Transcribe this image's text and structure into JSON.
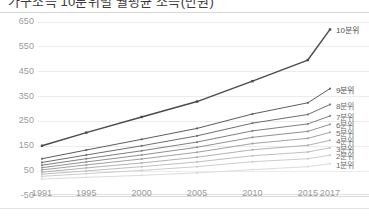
{
  "chart_data": {
    "type": "line",
    "title": "가구소득 10분위별 월평균 소득(만원)",
    "subtitle": "",
    "xlabel": "",
    "ylabel": "",
    "x": [
      1991,
      1995,
      2000,
      2005,
      2010,
      2015,
      2017
    ],
    "xtick_labels": [
      "1991",
      "1995",
      "2000",
      "2005",
      "2010",
      "2015",
      "2017"
    ],
    "ytick_labels": [
      "650",
      "550",
      "450",
      "350",
      "250",
      "150",
      "50",
      "-50"
    ],
    "ytick_values": [
      650,
      550,
      450,
      350,
      250,
      150,
      50,
      -50
    ],
    "ylim": [
      -50,
      680
    ],
    "xlim": [
      1991,
      2017
    ],
    "grid": true,
    "legend_position": "right-inline",
    "series": [
      {
        "name": "10분위",
        "label": "10분위",
        "color": "#4a4a4a",
        "values": [
          152,
          205,
          268,
          330,
          412,
          497,
          620
        ]
      },
      {
        "name": "9분위",
        "label": "9분위",
        "color": "#5c5c5c",
        "values": [
          100,
          135,
          178,
          222,
          280,
          325,
          382
        ]
      },
      {
        "name": "8분위",
        "label": "8분위",
        "color": "#6e6e6e",
        "values": [
          85,
          115,
          152,
          192,
          243,
          278,
          318
        ]
      },
      {
        "name": "7분위",
        "label": "7분위",
        "color": "#808080",
        "values": [
          74,
          100,
          132,
          167,
          212,
          240,
          272
        ]
      },
      {
        "name": "6분위",
        "label": "6분위",
        "color": "#929292",
        "values": [
          64,
          87,
          115,
          146,
          186,
          210,
          238
        ]
      },
      {
        "name": "5분위",
        "label": "5분위",
        "color": "#a2a2a2",
        "values": [
          55,
          75,
          99,
          126,
          161,
          182,
          206
        ]
      },
      {
        "name": "4분위",
        "label": "4분위",
        "color": "#b2b2b2",
        "values": [
          46,
          63,
          83,
          106,
          136,
          154,
          174
        ]
      },
      {
        "name": "3분위",
        "label": "3분위",
        "color": "#c0c0c0",
        "values": [
          38,
          51,
          68,
          87,
          112,
          127,
          144
        ]
      },
      {
        "name": "2분위",
        "label": "2분위",
        "color": "#cdcdcd",
        "values": [
          29,
          40,
          53,
          68,
          88,
          100,
          114
        ]
      },
      {
        "name": "1분위",
        "label": "1분위",
        "color": "#dcdcdc",
        "values": [
          18,
          25,
          33,
          43,
          56,
          68,
          80
        ]
      }
    ]
  },
  "axis": {
    "y_labels": [
      "650",
      "550",
      "450",
      "350",
      "250",
      "150",
      "50",
      "-50"
    ],
    "x_labels": [
      "1991",
      "1995",
      "2000",
      "2005",
      "2010",
      "2015",
      "2017"
    ]
  },
  "series_labels": [
    "10분위",
    "9분위",
    "8분위",
    "7분위",
    "6분위",
    "5분위",
    "4분위",
    "3분위",
    "2분위",
    "1분위"
  ]
}
